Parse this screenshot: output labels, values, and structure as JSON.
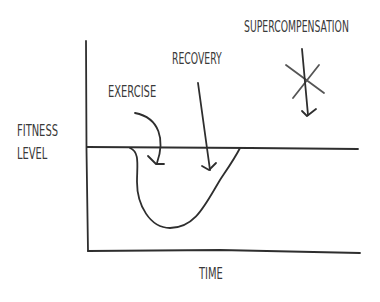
{
  "diagram": {
    "title": "Supercompensation",
    "labels": {
      "y_axis": [
        "FITNESS",
        "LEVEL"
      ],
      "x_axis": "TIME",
      "exercise": "EXERCISE",
      "recovery": "RECOVERY",
      "supercompensation": "SUPERCOMPENSATION"
    },
    "elements": {
      "y_axis_line": "vertical axis",
      "x_axis_line": "horizontal axis",
      "baseline": "baseline fitness level",
      "curve": "fatigue dip and recovery curve",
      "exercise_arrow": "curved arrow pointing to dip start",
      "recovery_arrow": "straight arrow pointing to recovery slope",
      "supercompensation_arrow": "arrow pointing down through star",
      "star_icon": "asterisk marking supercompensation"
    },
    "colors": {
      "line": "#2e2e2e",
      "text": "#3a3a3a",
      "star": "#555555",
      "background": "#ffffff"
    }
  }
}
